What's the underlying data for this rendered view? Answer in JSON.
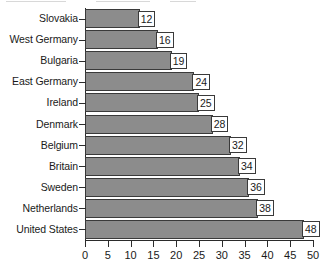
{
  "chart_data": {
    "type": "bar",
    "orientation": "horizontal",
    "title": "",
    "subtitle": "",
    "xlabel": "",
    "ylabel": "",
    "categories": [
      "Slovakia",
      "West Germany",
      "Bulgaria",
      "East Germany",
      "Ireland",
      "Denmark",
      "Belgium",
      "Britain",
      "Sweden",
      "Netherlands",
      "United States"
    ],
    "values": [
      12,
      16,
      19,
      24,
      25,
      28,
      32,
      34,
      36,
      38,
      48
    ],
    "data_labels": [
      "12",
      "16",
      "19",
      "24",
      "25",
      "28",
      "32",
      "34",
      "36",
      "38",
      "48"
    ],
    "xlim": [
      0,
      50
    ],
    "xticks": [
      0,
      5,
      10,
      15,
      20,
      25,
      30,
      35,
      40,
      45,
      50
    ],
    "xtick_labels": [
      "0",
      "5",
      "10",
      "15",
      "20",
      "25",
      "30",
      "35",
      "40",
      "45",
      "50"
    ],
    "grid": false,
    "legend": null,
    "legend_position": "none",
    "annotations": [],
    "colors": {
      "bar_fill": "#8c8c8c",
      "bar_border": "#3a3a3a",
      "axis": "#2b2b2b",
      "text": "#1a1a1a",
      "background": "#ffffff",
      "label_box_fill": "#ffffff",
      "label_box_border": "#3a3a3a"
    }
  }
}
